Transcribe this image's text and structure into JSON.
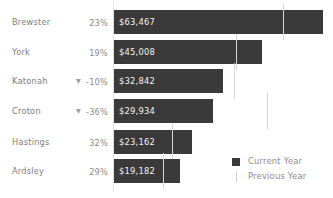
{
  "chart_data": {
    "type": "bar",
    "orientation": "horizontal",
    "title": "",
    "xlabel": "",
    "ylabel": "",
    "categories": [
      "Brewster",
      "York",
      "Katonah",
      "Croton",
      "Hastings",
      "Ardsley"
    ],
    "series": [
      {
        "name": "Current Year",
        "values": [
          63467,
          45008,
          32842,
          29934,
          23162,
          19182
        ],
        "value_labels": [
          "$63,467",
          "$45,008",
          "$32,842",
          "$29,934",
          "$23,162",
          "$19,182"
        ],
        "color": "#3a3a3a"
      },
      {
        "name": "Previous Year",
        "values": [
          51600,
          37800,
          36500,
          46800,
          17550,
          14900
        ],
        "color": "#d6d6d6",
        "marker": "vertical-tick"
      }
    ],
    "percent_change_labels": [
      "23%",
      "19%",
      "-10%",
      "-36%",
      "32%",
      "29%"
    ],
    "percent_change_direction": [
      "up",
      "up",
      "down",
      "down",
      "up",
      "up"
    ],
    "xlim": [
      0,
      66500
    ],
    "grid": false,
    "legend_position": "bottom-right"
  },
  "rows": [
    {
      "category": "Brewster",
      "pct": "23%",
      "arrow": "",
      "value_label": "$63,467",
      "bar_px": 209,
      "prev_px": 169,
      "top": 7
    },
    {
      "category": "York",
      "pct": "19%",
      "arrow": "",
      "value_label": "$45,008",
      "bar_px": 148,
      "prev_px": 122,
      "top": 37
    },
    {
      "category": "Katonah",
      "pct": "-10%",
      "arrow": "▼",
      "value_label": "$32,842",
      "bar_px": 109,
      "prev_px": 120,
      "top": 66
    },
    {
      "category": "Croton",
      "pct": "-36%",
      "arrow": "▼",
      "value_label": "$29,934",
      "bar_px": 99,
      "prev_px": 153,
      "top": 96
    },
    {
      "category": "Hastings",
      "pct": "32%",
      "arrow": "",
      "value_label": "$23,162",
      "bar_px": 78,
      "prev_px": 58,
      "top": 127
    },
    {
      "category": "Ardsley",
      "pct": "29%",
      "arrow": "",
      "value_label": "$19,182",
      "bar_px": 66,
      "prev_px": 49,
      "top": 156
    }
  ],
  "legend": {
    "current_label": "Current Year",
    "previous_label": "Previous Year",
    "current_color": "#3a3a3a",
    "previous_color": "#d6d6d6"
  }
}
